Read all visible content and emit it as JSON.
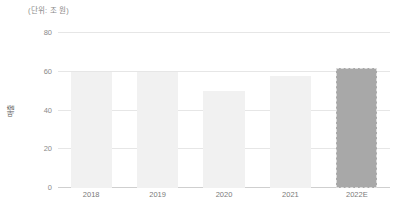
{
  "chart_data": {
    "type": "bar",
    "title": "",
    "subtitle": "",
    "unit_note": "(단위: 조 원)",
    "xlabel": "",
    "ylabel": "매출",
    "categories": [
      "2018",
      "2019",
      "2020",
      "2021",
      "2022E"
    ],
    "values": [
      60,
      60,
      50,
      58,
      62
    ],
    "series": [
      {
        "name": "매출",
        "values": [
          60,
          60,
          50,
          58,
          62
        ]
      }
    ],
    "ylim": [
      0,
      80
    ],
    "yticks": [
      0,
      20,
      40,
      60,
      80
    ],
    "ytick_labels": [
      "0",
      "20",
      "40",
      "60",
      "80"
    ],
    "grid": true,
    "legend": false,
    "legend_position": "none",
    "bar_colors": [
      "#f1f1f1",
      "#f1f1f1",
      "#f1f1f1",
      "#f1f1f1",
      "#a8a8a8"
    ],
    "forecast_index": 4,
    "annotations": []
  },
  "colors": {
    "background": "#ffffff",
    "bar_actual": "#f1f1f1",
    "bar_forecast": "#a8a8a8",
    "forecast_border": "#dddddd",
    "gridline": "#e6e6e6",
    "baseline": "#cfcfcf",
    "tick_text": "#8a8a8a",
    "axis_text": "#7a7a7a",
    "axis_title": "#555555"
  }
}
